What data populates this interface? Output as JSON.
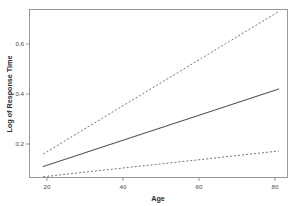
{
  "chart_data": {
    "type": "line",
    "title": "",
    "subtitle": "",
    "xlabel": "Age",
    "ylabel": "Log of Response Time",
    "xlim": [
      18,
      82
    ],
    "ylim": [
      0.045,
      0.76
    ],
    "xticks": [
      20,
      40,
      60,
      80
    ],
    "xtick_labels": [
      "20",
      "40",
      "60",
      "80"
    ],
    "yticks": [
      0.2,
      0.4,
      0.6
    ],
    "ytick_labels": [
      "0.2",
      "0.4",
      "0.6"
    ],
    "grid": false,
    "legend": null,
    "legend_position": "none",
    "annotations": [],
    "x": [
      19,
      81
    ],
    "series": [
      {
        "name": "upper band",
        "style": "dashed",
        "color": "#6b6b6b",
        "x": [
          19,
          81
        ],
        "values": [
          0.16,
          0.73
        ]
      },
      {
        "name": "fitted line",
        "style": "solid",
        "color": "#555555",
        "x": [
          19,
          81
        ],
        "values": [
          0.11,
          0.42
        ]
      },
      {
        "name": "lower band",
        "style": "dashed",
        "color": "#6b6b6b",
        "x": [
          19,
          81
        ],
        "values": [
          0.069,
          0.172
        ]
      }
    ]
  },
  "axes": {
    "x_title": "Age",
    "y_title": "Log of Response Time",
    "x_tick_labels": [
      "20",
      "40",
      "60",
      "80"
    ],
    "y_tick_labels": [
      "0.2",
      "0.4",
      "0.6"
    ]
  },
  "colors": {
    "background": "#ffffff",
    "frame": "#8d8d8d",
    "solid_series": "#555555",
    "dashed_series": "#6b6b6b",
    "tick_text": "#4a4a4a",
    "axis_title_text": "#2b2b2b"
  }
}
